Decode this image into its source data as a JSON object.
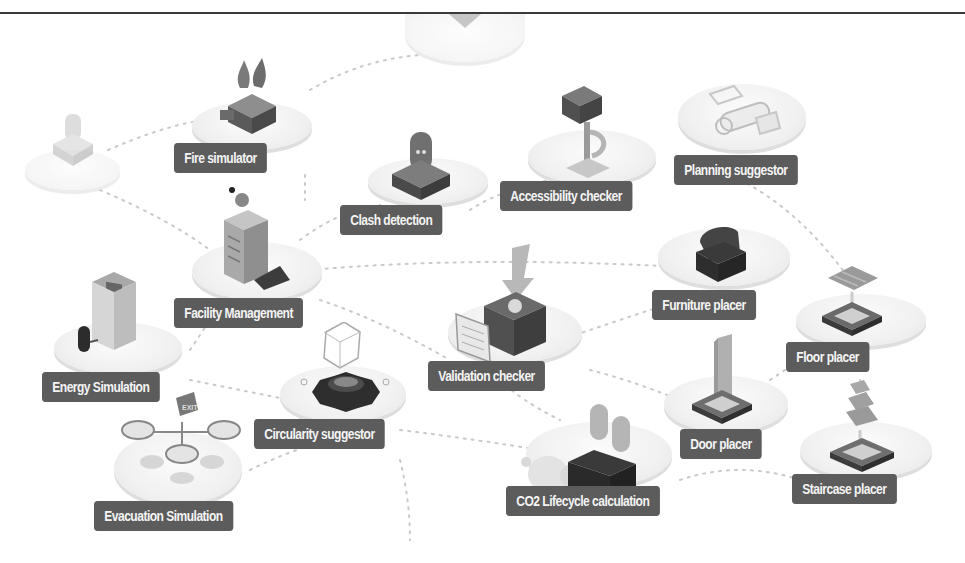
{
  "diagram": {
    "title": "",
    "colors": {
      "label_bg": "#5c5c5c",
      "label_text": "#f4f4f4",
      "platform": "#f1f1f1",
      "link": "#c8c8c8",
      "icon_dark": "#3c3c3c",
      "icon_mid": "#8a8a8a",
      "icon_light": "#bdbdbd"
    },
    "nodes": [
      {
        "id": "fire-simulator",
        "label": "Fire simulator",
        "icon": "flame-machine-icon"
      },
      {
        "id": "clash-detection",
        "label": "Clash detection",
        "icon": "robot-capsule-icon"
      },
      {
        "id": "accessibility-checker",
        "label": "Accessibility checker",
        "icon": "ramp-stairs-icon"
      },
      {
        "id": "planning-suggestor",
        "label": "Planning suggestor",
        "icon": "blueprint-roll-icon"
      },
      {
        "id": "facility-management",
        "label": "Facility Management",
        "icon": "server-building-icon"
      },
      {
        "id": "furniture-placer",
        "label": "Furniture placer",
        "icon": "armchair-icon"
      },
      {
        "id": "floor-placer",
        "label": "Floor placer",
        "icon": "floor-tile-icon"
      },
      {
        "id": "energy-simulation",
        "label": "Energy Simulation",
        "icon": "generator-icon"
      },
      {
        "id": "validation-checker",
        "label": "Validation checker",
        "icon": "document-checkbox-icon"
      },
      {
        "id": "circularity-suggestor",
        "label": "Circularity suggestor",
        "icon": "gear-cycle-icon"
      },
      {
        "id": "door-placer",
        "label": "Door placer",
        "icon": "door-icon"
      },
      {
        "id": "staircase-placer",
        "label": "Staircase placer",
        "icon": "staircase-icon"
      },
      {
        "id": "evacuation-simulation",
        "label": "Evacuation Simulation",
        "icon": "exit-sign-icon"
      },
      {
        "id": "co2-lifecycle-calculation",
        "label": "CO2 Lifecycle calculation",
        "icon": "factory-smoke-icon"
      }
    ],
    "faded_nodes": [
      {
        "id": "top-center-faded",
        "icon": "funnel-icon"
      },
      {
        "id": "left-faded",
        "icon": "sensor-icon"
      }
    ]
  }
}
